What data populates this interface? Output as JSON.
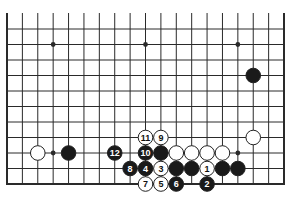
{
  "diagram": {
    "type": "go-board-fragment",
    "columns_visible": 19,
    "rows_visible": 11,
    "edges": {
      "left": true,
      "right": true,
      "bottom": true,
      "top": false
    },
    "colors": {
      "line": "#2a2a2a",
      "black_stone": "#1a1a1a",
      "white_stone": "#ffffff",
      "background": "#ffffff"
    },
    "grid": {
      "x0": 7,
      "dx": 15.39,
      "y_bottom": 184,
      "dy": 15.5,
      "top_extension_y": 13
    },
    "star_points": [
      {
        "col": 3,
        "row": 10
      },
      {
        "col": 9,
        "row": 10
      },
      {
        "col": 15,
        "row": 10
      },
      {
        "col": 3,
        "row": 3
      },
      {
        "col": 15,
        "row": 3
      }
    ],
    "stones": [
      {
        "color": "black",
        "col": 16,
        "row": 8,
        "label": ""
      },
      {
        "color": "white",
        "col": 2,
        "row": 3,
        "label": ""
      },
      {
        "color": "black",
        "col": 4,
        "row": 3,
        "label": ""
      },
      {
        "color": "black",
        "col": 7,
        "row": 3,
        "label": "12"
      },
      {
        "color": "white",
        "col": 9,
        "row": 4,
        "label": "11"
      },
      {
        "color": "white",
        "col": 10,
        "row": 4,
        "label": "9"
      },
      {
        "color": "black",
        "col": 9,
        "row": 3,
        "label": "10"
      },
      {
        "color": "black",
        "col": 10,
        "row": 3,
        "label": ""
      },
      {
        "color": "white",
        "col": 11,
        "row": 3,
        "label": ""
      },
      {
        "color": "white",
        "col": 12,
        "row": 3,
        "label": ""
      },
      {
        "color": "white",
        "col": 13,
        "row": 3,
        "label": ""
      },
      {
        "color": "white",
        "col": 14,
        "row": 3,
        "label": ""
      },
      {
        "color": "white",
        "col": 16,
        "row": 4,
        "label": ""
      },
      {
        "color": "black",
        "col": 8,
        "row": 2,
        "label": "8"
      },
      {
        "color": "black",
        "col": 9,
        "row": 2,
        "label": "4"
      },
      {
        "color": "white",
        "col": 10,
        "row": 2,
        "label": "3"
      },
      {
        "color": "black",
        "col": 11,
        "row": 2,
        "label": ""
      },
      {
        "color": "black",
        "col": 12,
        "row": 2,
        "label": ""
      },
      {
        "color": "white",
        "col": 13,
        "row": 2,
        "label": "1"
      },
      {
        "color": "black",
        "col": 14,
        "row": 2,
        "label": ""
      },
      {
        "color": "black",
        "col": 15,
        "row": 2,
        "label": ""
      },
      {
        "color": "white",
        "col": 9,
        "row": 1,
        "label": "7"
      },
      {
        "color": "white",
        "col": 10,
        "row": 1,
        "label": "5"
      },
      {
        "color": "black",
        "col": 11,
        "row": 1,
        "label": "6"
      },
      {
        "color": "black",
        "col": 13,
        "row": 1,
        "label": "2"
      }
    ]
  }
}
